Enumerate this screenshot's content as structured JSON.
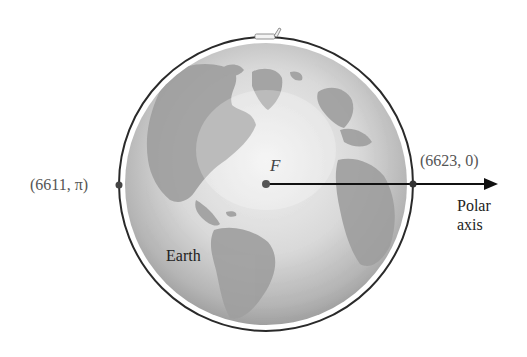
{
  "figure": {
    "type": "polar-orbit-diagram",
    "colors": {
      "orbit": "#2a2a2a",
      "globe_light": "#e6e6e6",
      "globe_dark": "#8f8f8f",
      "land": "#9a9a9a",
      "arrow": "#111111",
      "point": "#555555"
    },
    "geometry": {
      "focus": {
        "x": 266,
        "y": 184
      },
      "orbit_radius": 147,
      "globe_radius": 141,
      "arrow_end_x": 498
    }
  },
  "labels": {
    "focus": "F",
    "left_point": {
      "r": "6611",
      "theta": "π",
      "text": "(6611, π)"
    },
    "right_point": {
      "r": "6623",
      "theta": "0",
      "text": "(6623, 0)"
    },
    "earth": "Earth",
    "polar_axis_line1": "Polar",
    "polar_axis_line2": "axis"
  },
  "icons": {
    "satellite": "satellite-icon"
  }
}
